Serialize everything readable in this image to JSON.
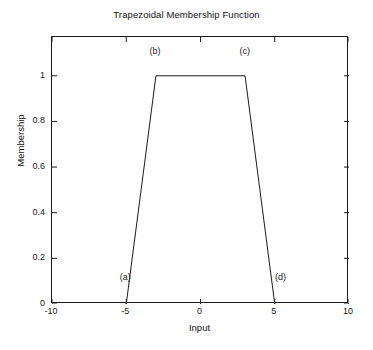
{
  "chart_data": {
    "type": "line",
    "title": "Trapezoidal Membership Function",
    "xlabel": "Input",
    "ylabel": "Membership",
    "xlim": [
      -10,
      10
    ],
    "ylim": [
      0,
      1.17
    ],
    "grid": false,
    "legend": null,
    "x": [
      -10,
      -5,
      -3,
      3,
      5,
      10
    ],
    "values": [
      0,
      0,
      1,
      1,
      0,
      0
    ],
    "series": [
      {
        "name": "Trapezoidal membership",
        "x": [
          -5,
          -3,
          3,
          5
        ],
        "values": [
          0,
          1,
          1,
          0
        ]
      }
    ],
    "xticks": [
      -10,
      -5,
      0,
      5,
      10
    ],
    "xticklabels": [
      "-10",
      "-5",
      "0",
      "5",
      "10"
    ],
    "yticks": [
      0,
      0.2,
      0.4,
      0.6,
      0.8,
      1
    ],
    "yticklabels": [
      "0",
      "0.2",
      "0.4",
      "0.6",
      "0.8",
      "1"
    ],
    "annotations": [
      {
        "text": "(a)",
        "x": -5.0,
        "y": 0.115,
        "param": "a"
      },
      {
        "text": "(b)",
        "x": -3.0,
        "y": 1.105,
        "param": "b"
      },
      {
        "text": "(c)",
        "x": 3.05,
        "y": 1.105,
        "param": "c"
      },
      {
        "text": "(d)",
        "x": 5.45,
        "y": 0.115,
        "param": "d"
      }
    ],
    "line_color": "#1a1a1a",
    "axis_color": "#1a1a1a",
    "background_color": "#ffffff"
  }
}
